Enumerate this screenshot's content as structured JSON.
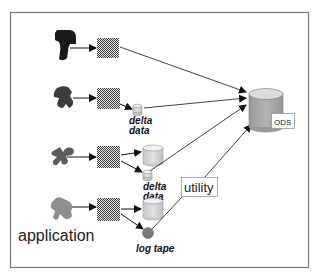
{
  "diagram": {
    "title": "",
    "labels": {
      "application": "application",
      "delta_data_1_line1": "delta",
      "delta_data_1_line2": "data",
      "delta_data_2_line1": "delta",
      "delta_data_2_line2": "data",
      "log_tape": "log tape",
      "utility": "utility",
      "ods": "ODS"
    },
    "nodes": [
      {
        "id": "app1",
        "type": "application-shape",
        "color": "#1a1a1a"
      },
      {
        "id": "app2",
        "type": "application-shape",
        "color": "#3a3a3a"
      },
      {
        "id": "app3",
        "type": "application-shape",
        "color": "#5a5a5a"
      },
      {
        "id": "app4",
        "type": "application-shape",
        "color": "#8c8c8c"
      },
      {
        "id": "proc1",
        "type": "checkered-box"
      },
      {
        "id": "proc2",
        "type": "checkered-box"
      },
      {
        "id": "proc3",
        "type": "checkered-box"
      },
      {
        "id": "proc4",
        "type": "checkered-box"
      },
      {
        "id": "delta1",
        "type": "small-cylinder",
        "label": "delta data"
      },
      {
        "id": "db3",
        "type": "cylinder"
      },
      {
        "id": "delta2",
        "type": "small-cylinder",
        "label": "delta data"
      },
      {
        "id": "db4",
        "type": "cylinder"
      },
      {
        "id": "logtape",
        "type": "circle",
        "label": "log tape"
      },
      {
        "id": "ods",
        "type": "large-cylinder",
        "label": "ODS"
      },
      {
        "id": "utility",
        "type": "label-box",
        "label": "utility"
      }
    ],
    "edges": [
      {
        "from": "app1",
        "to": "proc1"
      },
      {
        "from": "proc1",
        "to": "ods"
      },
      {
        "from": "app2",
        "to": "proc2"
      },
      {
        "from": "proc2",
        "to": "delta1"
      },
      {
        "from": "delta1",
        "to": "ods"
      },
      {
        "from": "app3",
        "to": "proc3"
      },
      {
        "from": "proc3",
        "to": "db3"
      },
      {
        "from": "proc3",
        "to": "delta2"
      },
      {
        "from": "delta2",
        "to": "ods"
      },
      {
        "from": "app4",
        "to": "proc4"
      },
      {
        "from": "proc4",
        "to": "db4"
      },
      {
        "from": "proc4",
        "to": "logtape"
      },
      {
        "from": "logtape",
        "to": "ods",
        "via": "utility"
      }
    ],
    "colors": {
      "frame": "#777777",
      "cylinder_body": "#c8c8c8",
      "cylinder_top": "#e6e6e6",
      "ods_body": "#a9a9a9",
      "ods_top": "#d9d9d9",
      "log_tape": "#7a7a7a",
      "arrow": "#111111"
    }
  }
}
